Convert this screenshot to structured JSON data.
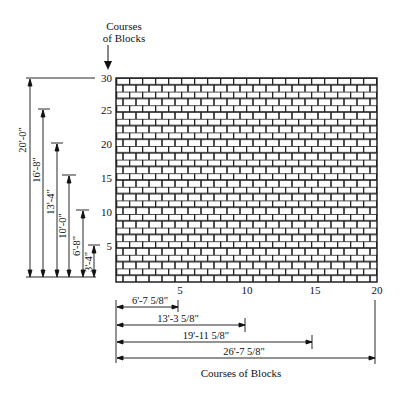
{
  "diagram": {
    "top_label": [
      "Courses",
      "of Blocks"
    ],
    "bottom_label": "Courses of Blocks",
    "vertical_ticks": [
      "30",
      "25",
      "20",
      "15",
      "10",
      "5"
    ],
    "horizontal_ticks": [
      "5",
      "10",
      "15",
      "20"
    ],
    "vertical_dimensions": [
      {
        "course": 30,
        "label": "20'-0\""
      },
      {
        "course": 25,
        "label": "16'-8\""
      },
      {
        "course": 20,
        "label": "13'-4\""
      },
      {
        "course": 15,
        "label": "10'-0\""
      },
      {
        "course": 10,
        "label": "6'-8\""
      },
      {
        "course": 5,
        "label": "3'-4\""
      }
    ],
    "horizontal_dimensions": [
      {
        "course": 5,
        "label": "6'-7 5/8\""
      },
      {
        "course": 10,
        "label": "13'-3 5/8\""
      },
      {
        "course": 15,
        "label": "19'-11 5/8\""
      },
      {
        "course": 20,
        "label": "26'-7 5/8\""
      }
    ]
  }
}
